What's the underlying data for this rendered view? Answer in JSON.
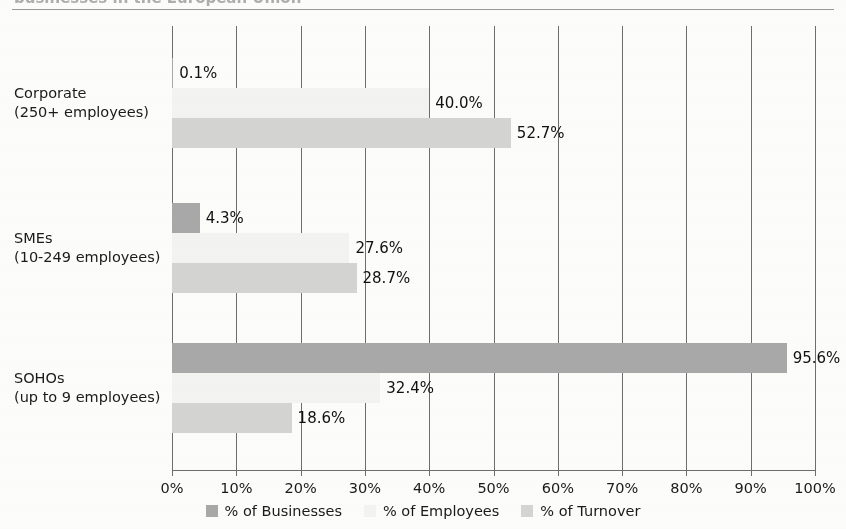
{
  "header": {
    "cut_off_title": "businesses in the European Union",
    "rule_visible": true
  },
  "chart_data": {
    "type": "bar",
    "orientation": "horizontal",
    "title": "",
    "xlabel": "",
    "ylabel": "",
    "xlim": [
      0,
      100
    ],
    "grid": true,
    "legend_position": "bottom",
    "categories": [
      "Corporate\n(250+ employees)",
      "SMEs\n(10-249 employees)",
      "SOHOs\n(up to 9 employees)"
    ],
    "category_lines": [
      [
        "Corporate",
        "(250+ employees)"
      ],
      [
        "SMEs",
        "(10-249 employees)"
      ],
      [
        "SOHOs",
        "(up to 9 employees)"
      ]
    ],
    "series": [
      {
        "name": "% of Businesses",
        "color": "#a9a9a9",
        "values": [
          0.1,
          4.3,
          95.6
        ],
        "labels": [
          "0.1%",
          "4.3%",
          "95.6%"
        ]
      },
      {
        "name": "% of Employees",
        "color": "#f4f4f2",
        "values": [
          40.0,
          27.6,
          32.4
        ],
        "labels": [
          "40.0%",
          "27.6%",
          "32.4%"
        ]
      },
      {
        "name": "% of Turnover",
        "color": "#d5d5d3",
        "values": [
          52.7,
          28.7,
          18.6
        ],
        "labels": [
          "52.7%",
          "28.7%",
          "18.6%"
        ]
      }
    ],
    "xticks": [
      0,
      10,
      20,
      30,
      40,
      50,
      60,
      70,
      80,
      90,
      100
    ],
    "xtick_labels": [
      "0%",
      "10%",
      "20%",
      "30%",
      "40%",
      "50%",
      "60%",
      "70%",
      "80%",
      "90%",
      "100%"
    ]
  }
}
